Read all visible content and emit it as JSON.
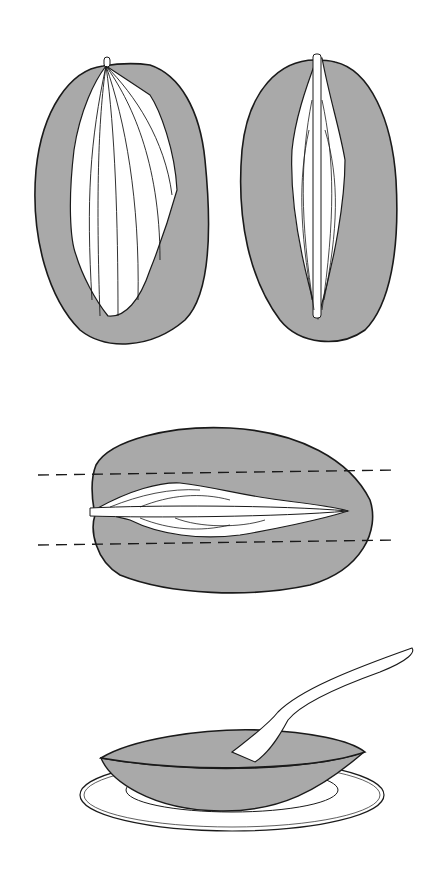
{
  "diagram": {
    "type": "illustration",
    "colors": {
      "flesh": "#a9a9a9",
      "outline": "#1a1a1a",
      "pit": "#ffffff",
      "background": "#ffffff"
    },
    "panels": [
      {
        "id": "mango-side-view-left",
        "label": ""
      },
      {
        "id": "mango-side-view-right",
        "label": ""
      },
      {
        "id": "mango-top-view-cut-lines",
        "label": ""
      },
      {
        "id": "mango-cheek-with-spoon",
        "label": ""
      }
    ]
  }
}
